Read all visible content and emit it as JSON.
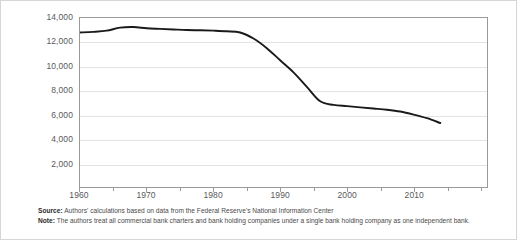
{
  "chart_data": {
    "type": "line",
    "title": "",
    "xlabel": "",
    "ylabel": "",
    "xlim": [
      1960,
      2021
    ],
    "ylim": [
      0,
      14000
    ],
    "grid": true,
    "legend": false,
    "y_ticks": [
      14000,
      12000,
      10000,
      8000,
      6000,
      4000,
      2000
    ],
    "y_tick_labels": [
      "14,000",
      "12,000",
      "10,000",
      "8,000",
      "6,000",
      "4,000",
      "2,000"
    ],
    "x_ticks": [
      1960,
      1965,
      1970,
      1975,
      1980,
      1985,
      1990,
      1995,
      2000,
      2005,
      2010,
      2015,
      2020
    ],
    "x_tick_labels": [
      "1960",
      "1970",
      "1980",
      "1990",
      "2000",
      "2010"
    ],
    "x_labeled_ticks": [
      1960,
      1970,
      1980,
      1990,
      2000,
      2010
    ],
    "line_color": "#1a1a1a",
    "series": [
      {
        "name": "Number of independent banks",
        "x": [
          1960,
          1962,
          1964,
          1966,
          1968,
          1970,
          1972,
          1974,
          1976,
          1978,
          1980,
          1982,
          1984,
          1986,
          1988,
          1990,
          1992,
          1994,
          1996,
          1998,
          2000,
          2002,
          2004,
          2006,
          2008,
          2010,
          2012,
          2014
        ],
        "values": [
          12800,
          12850,
          12950,
          13200,
          13250,
          13150,
          13100,
          13050,
          13000,
          12980,
          12950,
          12900,
          12800,
          12300,
          11500,
          10500,
          9500,
          8300,
          7100,
          6800,
          6700,
          6600,
          6500,
          6400,
          6250,
          6000,
          5700,
          5300
        ]
      }
    ]
  },
  "notes": {
    "source_label": "Source:",
    "source_text": " Authors' calculations based on data from the Federal Reserve's National Information Center",
    "note_label": "Note:",
    "note_text": " The authors treat all commercial bank charters and bank holding companies under a single bank holding company as one independent bank."
  }
}
